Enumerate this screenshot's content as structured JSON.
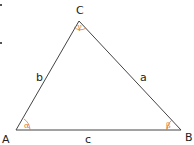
{
  "diagram": {
    "vertices": [
      {
        "name": "A",
        "x": 16,
        "y": 130
      },
      {
        "name": "B",
        "x": 181,
        "y": 130
      },
      {
        "name": "C",
        "x": 79,
        "y": 21
      }
    ],
    "sides": [
      {
        "name": "a",
        "from": "B",
        "to": "C"
      },
      {
        "name": "b",
        "from": "A",
        "to": "C"
      },
      {
        "name": "c",
        "from": "A",
        "to": "B"
      }
    ],
    "angles": [
      {
        "vertex": "A",
        "symbol": "α"
      },
      {
        "vertex": "B",
        "symbol": "β"
      },
      {
        "vertex": "C",
        "symbol": "γ"
      }
    ],
    "colors": {
      "line": "#444444",
      "angle": "#e07b39",
      "text": "#222222"
    }
  },
  "labels": {
    "A": "A",
    "B": "B",
    "C": "C",
    "a": "a",
    "b": "b",
    "c": "c",
    "alpha": "α",
    "beta": "β",
    "gamma": "γ"
  }
}
